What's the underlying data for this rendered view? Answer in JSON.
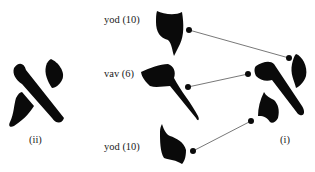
{
  "figure": {
    "letter_ii": {
      "caption": "(ii)",
      "glyph": "aleph"
    },
    "letter_i": {
      "caption": "(i)",
      "glyph": "aleph-composite"
    },
    "components": [
      {
        "name": "yod",
        "value": "10",
        "label": "yod (10)",
        "position": "top"
      },
      {
        "name": "vav",
        "value": "6",
        "label": "vav (6)",
        "position": "middle"
      },
      {
        "name": "yod",
        "value": "10",
        "label": "yod (10)",
        "position": "bottom"
      }
    ],
    "colors": {
      "ink": "#0a0a0a",
      "line": "#555555",
      "background": "#ffffff"
    }
  }
}
